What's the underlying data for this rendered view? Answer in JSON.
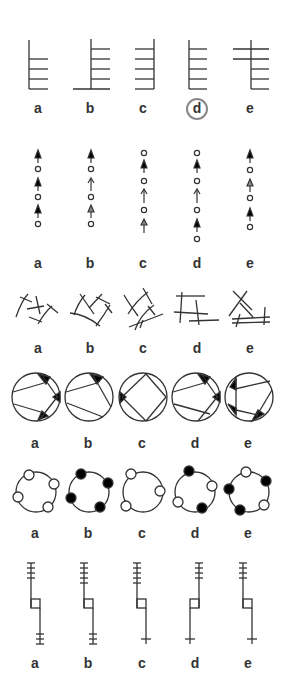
{
  "colors": {
    "stroke": "#333333",
    "fill": "#000000",
    "circle_badge": "#888888",
    "background": "#ffffff"
  },
  "rows": [
    {
      "id": "ladders",
      "labels": [
        "a",
        "b",
        "c",
        "d",
        "e"
      ],
      "selected": "d"
    },
    {
      "id": "arrow-sequences",
      "labels": [
        "a",
        "b",
        "c",
        "d",
        "e"
      ],
      "sequences": [
        [
          "arrow-filled",
          "dot",
          "arrow-filled",
          "dot",
          "arrow-filled",
          "dot"
        ],
        [
          "arrow-filled",
          "dot",
          "arrow-open",
          "dot",
          "arrow-half",
          "dot"
        ],
        [
          "dot",
          "arrow-filled",
          "dot",
          "arrow-open",
          "dot",
          "arrow-half"
        ],
        [
          "dot",
          "arrow-filled",
          "dot",
          "arrow-open",
          "dot",
          "arrow-filled",
          "dot"
        ],
        [
          "arrow-filled",
          "dot",
          "arrow-half",
          "dot",
          "arrow-filled",
          "dot"
        ]
      ]
    },
    {
      "id": "crossed-lines",
      "labels": [
        "a",
        "b",
        "c",
        "d",
        "e"
      ]
    },
    {
      "id": "inscribed-circles",
      "labels": [
        "a",
        "b",
        "c",
        "d",
        "e"
      ]
    },
    {
      "id": "beaded-rings",
      "labels": [
        "a",
        "b",
        "c",
        "d",
        "e"
      ],
      "beads": [
        [
          "white",
          "white",
          "white",
          "white"
        ],
        [
          "black",
          "black",
          "black",
          "black"
        ],
        [
          "white",
          "white",
          "white"
        ],
        [
          "black",
          "white",
          "black",
          "white"
        ],
        [
          "white",
          "black",
          "white",
          "black",
          "black"
        ]
      ]
    },
    {
      "id": "stepped-stems",
      "labels": [
        "a",
        "b",
        "c",
        "d",
        "e"
      ],
      "top_ticks": [
        4,
        5,
        5,
        4,
        4
      ],
      "bottom_ticks": [
        3,
        3,
        1,
        1,
        1
      ]
    }
  ]
}
